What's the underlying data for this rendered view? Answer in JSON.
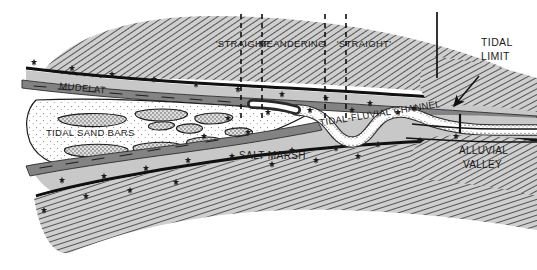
{
  "figure": {
    "type": "geological-cross-section-plan-diagram",
    "title_visible": false,
    "background_color": "#ffffff"
  },
  "labels": {
    "mudflat": "MUDFLAT",
    "tidal_sand_bars": "TIDAL SAND BARS",
    "salt_marsh": "SALT MARSH",
    "tidal_fluvial_channel": "TIDAL-FLUVIAL CHANNEL",
    "tidal_limit_line1": "TIDAL",
    "tidal_limit_line2": "LIMIT",
    "alluvial_valley_line1": "ALLUVIAL",
    "alluvial_valley_line2": "VALLEY"
  },
  "reach_labels": [
    {
      "text": "'STRAIGHT'",
      "x": 243,
      "y": 47
    },
    {
      "text": "MEANDERING",
      "x": 292,
      "y": 47
    },
    {
      "text": "'STRAIGHT'",
      "x": 363,
      "y": 47
    }
  ],
  "divider_lines": [
    {
      "name": "divider-straight-left",
      "x": 241,
      "y1": 14,
      "y2": 122,
      "style": "dashed"
    },
    {
      "name": "divider-meandering-start",
      "x": 262,
      "y1": 14,
      "y2": 122,
      "style": "dashed"
    },
    {
      "name": "divider-meandering-end",
      "x": 325,
      "y1": 14,
      "y2": 122,
      "style": "dashed"
    },
    {
      "name": "divider-straight-right",
      "x": 346,
      "y1": 14,
      "y2": 122,
      "style": "dashed"
    }
  ],
  "tidal_limit_marker": {
    "vertical_line": {
      "x": 437,
      "y1": 12,
      "y2": 78,
      "style": "solid"
    },
    "channel_tick": {
      "x": 460,
      "y1": 114,
      "y2": 133,
      "style": "solid"
    },
    "arrow": {
      "from_x": 478,
      "from_y": 76,
      "to_x": 453,
      "to_y": 107
    }
  },
  "colors": {
    "upland_hatch_fill": "#c9c9c9",
    "upland_hatch_line": "#3a3a3a",
    "salt_marsh_fill": "#c8c8c8",
    "mudflat_fill": "#838383",
    "sand_bar_fill": "#d6d6d6",
    "estuary_fill": "#ffffff",
    "channel_fill": "#ffffff",
    "outline": "#111111",
    "text": "#1a1a1a"
  },
  "legend_symbols": {
    "marsh_symbol": "star-glyph",
    "sand_texture": "stipple-dots",
    "upland_texture": "diagonal-hatching"
  }
}
